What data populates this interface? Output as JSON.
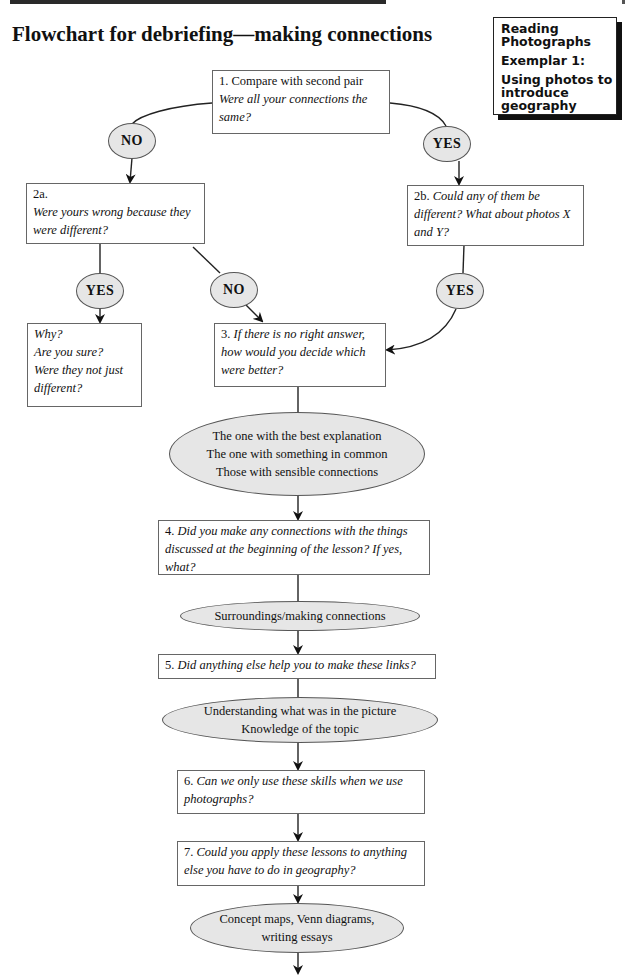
{
  "header": {
    "title": "Flowchart for debriefing—making connections"
  },
  "sidebar": {
    "line1": "Reading Photographs",
    "line2": "Exemplar 1:",
    "line3": "Using photos to introduce geography"
  },
  "flowchart": {
    "box1": {
      "number": "1. Compare with second pair",
      "question": "Were all your connections the same?"
    },
    "no1": "NO",
    "yes1": "YES",
    "box2a": {
      "number": "2a.",
      "question": "Were yours wrong because they were different?"
    },
    "box2b": {
      "number": "2b.",
      "question": "Could any of them be different? What about photos X and Y?"
    },
    "yes2a": "YES",
    "no2a": "NO",
    "yes2b": "YES",
    "why_box": {
      "lines": [
        "Why?",
        "Are you sure?",
        "Were they not just",
        "different?"
      ]
    },
    "box3": {
      "number": "3.",
      "question": "If there is no right answer, how would you decide which were better?"
    },
    "answers3": [
      "The one with the best explanation",
      "The one with something in common",
      "Those with sensible connections"
    ],
    "box4": {
      "number": "4.",
      "question": "Did you make any connections with the things discussed at the beginning of the lesson? If yes, what?"
    },
    "answers4": [
      "Surroundings/making connections"
    ],
    "box5": {
      "number": "5.",
      "question": "Did anything else help you to make these links?"
    },
    "answers5": [
      "Understanding what was in the picture",
      "Knowledge of the topic"
    ],
    "box6": {
      "number": "6.",
      "question": "Can we only use these skills when we use photographs?"
    },
    "box7": {
      "number": "7.",
      "question": "Could you apply these lessons to anything else you have to do in geography?"
    },
    "answers7": [
      "Concept maps, Venn diagrams,",
      "writing essays"
    ]
  }
}
